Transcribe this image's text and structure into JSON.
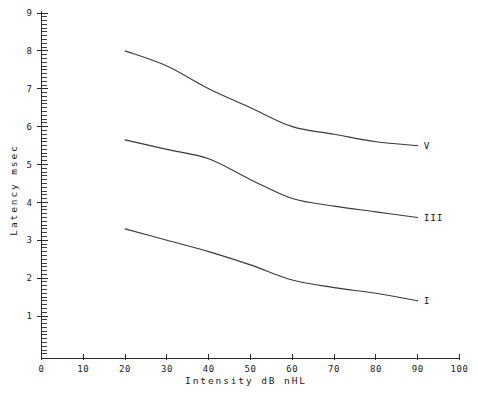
{
  "chart_data": {
    "type": "line",
    "title": "",
    "xlabel": "Intensity dB nHL",
    "ylabel": "Latency  msec",
    "xlim": [
      0,
      100
    ],
    "ylim": [
      0,
      9
    ],
    "xticks": [
      0,
      10,
      20,
      30,
      40,
      50,
      60,
      70,
      80,
      90,
      100
    ],
    "xticklabels": [
      "0",
      "10",
      "20",
      "30",
      "40",
      "50",
      "60",
      "70",
      "80",
      "90",
      "100"
    ],
    "yticks": [
      1,
      2,
      3,
      4,
      5,
      6,
      7,
      8,
      9
    ],
    "yticklabels": [
      "1",
      "2",
      "3",
      "4",
      "5",
      "6",
      "7",
      "8",
      "9"
    ],
    "minor_ticks": true,
    "minor_tick_step": 0.1,
    "grid": false,
    "legend_position": "right-end-of-line",
    "line_color": "#3a3a3a",
    "background": "#ffffff",
    "series": [
      {
        "name": "V",
        "label": "V",
        "x": [
          20,
          30,
          40,
          50,
          60,
          70,
          80,
          90
        ],
        "values": [
          8.0,
          7.6,
          7.0,
          6.5,
          6.0,
          5.8,
          5.6,
          5.5
        ]
      },
      {
        "name": "III",
        "label": "III",
        "x": [
          20,
          30,
          40,
          50,
          60,
          70,
          80,
          90
        ],
        "values": [
          5.65,
          5.4,
          5.15,
          4.6,
          4.1,
          3.9,
          3.75,
          3.6
        ]
      },
      {
        "name": "I",
        "label": "I",
        "x": [
          20,
          30,
          40,
          50,
          60,
          70,
          80,
          90
        ],
        "values": [
          3.3,
          3.0,
          2.7,
          2.35,
          1.95,
          1.75,
          1.6,
          1.4
        ]
      }
    ]
  },
  "labels": {
    "x_axis_title": "Intensity dB nHL",
    "y_axis_title": "Latency  msec",
    "series_v": "V",
    "series_iii": "III",
    "series_i": "I"
  }
}
